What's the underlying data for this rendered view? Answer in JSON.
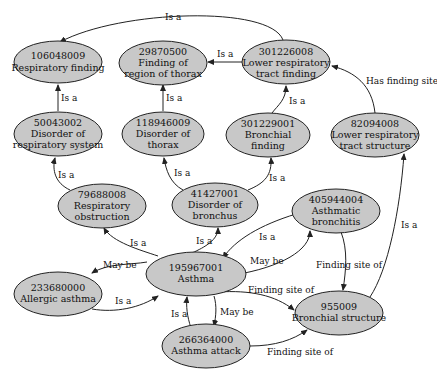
{
  "diagram": {
    "nodes": [
      {
        "id": "n106048009",
        "code": "106048009",
        "label1": "Respiratory finding",
        "label2": ""
      },
      {
        "id": "n29870500",
        "code": "29870500",
        "label1": "Finding of",
        "label2": "region of thorax"
      },
      {
        "id": "n301226008",
        "code": "301226008",
        "label1": "Lower respiratory",
        "label2": "tract finding"
      },
      {
        "id": "n50043002",
        "code": "50043002",
        "label1": "Disorder of",
        "label2": "respiratory system"
      },
      {
        "id": "n118946009",
        "code": "118946009",
        "label1": "Disorder of",
        "label2": "thorax"
      },
      {
        "id": "n301229001",
        "code": "301229001",
        "label1": "Bronchial",
        "label2": "finding"
      },
      {
        "id": "n82094008",
        "code": "82094008",
        "label1": "Lower respiratory",
        "label2": "tract structure"
      },
      {
        "id": "n79688008",
        "code": "79688008",
        "label1": "Respiratory",
        "label2": "obstruction"
      },
      {
        "id": "n41427001",
        "code": "41427001",
        "label1": "Disorder of",
        "label2": "bronchus"
      },
      {
        "id": "n405944004",
        "code": "405944004",
        "label1": "Asthmatic",
        "label2": "bronchitis"
      },
      {
        "id": "n233680000",
        "code": "233680000",
        "label1": "Allergic asthma",
        "label2": ""
      },
      {
        "id": "n195967001",
        "code": "195967001",
        "label1": "Asthma",
        "label2": ""
      },
      {
        "id": "n955009",
        "code": "955009",
        "label1": "Bronchial structure",
        "label2": ""
      },
      {
        "id": "n266364000",
        "code": "266364000",
        "label1": "Asthma attack",
        "label2": ""
      }
    ],
    "edges": [
      {
        "from": "301226008",
        "to": "106048009",
        "label": "Is a"
      },
      {
        "from": "301226008",
        "to": "29870500",
        "label": "Is a"
      },
      {
        "from": "50043002",
        "to": "106048009",
        "label": "Is a"
      },
      {
        "from": "118946009",
        "to": "29870500",
        "label": "Is a"
      },
      {
        "from": "301229001",
        "to": "301226008",
        "label": "Is a"
      },
      {
        "from": "82094008",
        "to": "301226008",
        "label": "Has finding site"
      },
      {
        "from": "79688008",
        "to": "50043002",
        "label": "Is a"
      },
      {
        "from": "41427001",
        "to": "118946009",
        "label": "Is a"
      },
      {
        "from": "41427001",
        "to": "301229001",
        "label": "Is a"
      },
      {
        "from": "195967001",
        "to": "79688008",
        "label": "Is a"
      },
      {
        "from": "195967001",
        "to": "41427001",
        "label": "Is a"
      },
      {
        "from": "405944004",
        "to": "195967001",
        "label": "Is a"
      },
      {
        "from": "195967001",
        "to": "405944004",
        "label": "May be"
      },
      {
        "from": "195967001",
        "to": "233680000",
        "label": "May be"
      },
      {
        "from": "233680000",
        "to": "195967001",
        "label": "Is a"
      },
      {
        "from": "195967001",
        "to": "266364000",
        "label": "May be"
      },
      {
        "from": "266364000",
        "to": "195967001",
        "label": "Is a"
      },
      {
        "from": "405944004",
        "to": "955009",
        "label": "Finding site of"
      },
      {
        "from": "195967001",
        "to": "955009",
        "label": "Finding site of"
      },
      {
        "from": "266364000",
        "to": "955009",
        "label": "Finding site of"
      },
      {
        "from": "955009",
        "to": "82094008",
        "label": "Is a"
      }
    ]
  },
  "edge_labels": {
    "e1": "Is a",
    "e2": "Is a",
    "e3": "Is a",
    "e4": "Is a",
    "e5": "Is a",
    "e6": "Has finding site",
    "e7": "Is a",
    "e8": "Is a",
    "e9": "Is a",
    "e10": "Is a",
    "e11": "Is a",
    "e12": "Is a",
    "e13": "May be",
    "e14": "May be",
    "e15": "Is a",
    "e16": "May be",
    "e17": "Is a",
    "e18": "Finding site of",
    "e19": "Finding site of",
    "e20": "Finding site of",
    "e21": "Is a"
  }
}
